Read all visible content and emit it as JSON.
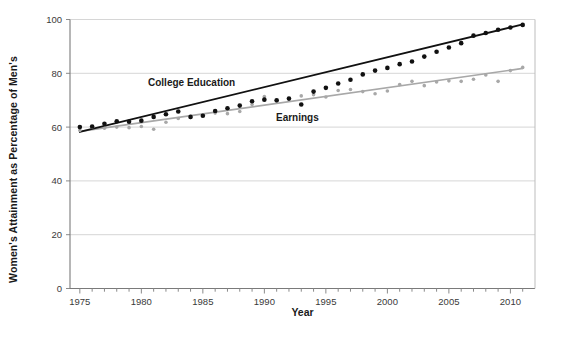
{
  "chart_data": {
    "type": "scatter",
    "title": "",
    "xlabel": "Year",
    "ylabel": "Women's Attainment as Percentage of Men's",
    "xlim": [
      1974.2,
      2012.0
    ],
    "ylim": [
      0,
      100
    ],
    "xticks": [
      1975,
      1980,
      1985,
      1990,
      1995,
      2000,
      2005,
      2010
    ],
    "xtick_labels": [
      "1975",
      "1980",
      "1985",
      "1990",
      "1995",
      "2000",
      "2005",
      "2010"
    ],
    "xtick_minor_step": 1,
    "yticks": [
      0,
      20,
      40,
      60,
      80,
      100
    ],
    "ytick_labels": [
      "0",
      "20",
      "40",
      "60",
      "80",
      "100"
    ],
    "grid": "horizontal",
    "legend_position": "inline-annotation",
    "series": [
      {
        "name": "College Education",
        "color": "#111111",
        "marker": "circle",
        "has_trendline": true,
        "trendline_color": "#111111",
        "trendline_start": [
          1975,
          58.2
        ],
        "trendline_end": [
          2011,
          98.2
        ],
        "x": [
          1975,
          1976,
          1977,
          1978,
          1979,
          1980,
          1981,
          1982,
          1983,
          1984,
          1985,
          1986,
          1987,
          1988,
          1989,
          1990,
          1991,
          1992,
          1993,
          1994,
          1995,
          1996,
          1997,
          1998,
          1999,
          2000,
          2001,
          2002,
          2003,
          2004,
          2005,
          2006,
          2007,
          2008,
          2009,
          2010,
          2011
        ],
        "y": [
          60.0,
          60.2,
          61.2,
          62.2,
          62.0,
          62.4,
          63.8,
          64.8,
          65.8,
          63.8,
          64.2,
          66.0,
          67.0,
          68.0,
          69.6,
          70.2,
          70.0,
          70.6,
          68.4,
          73.2,
          74.6,
          76.2,
          77.6,
          79.6,
          81.0,
          82.0,
          83.4,
          84.4,
          86.2,
          88.0,
          89.6,
          91.2,
          94.0,
          95.0,
          96.2,
          97.0,
          98.0
        ]
      },
      {
        "name": "Earnings",
        "color": "#a8a8a8",
        "marker": "circle",
        "has_trendline": true,
        "trendline_color": "#a8a8a8",
        "trendline_start": [
          1975,
          58.4
        ],
        "trendline_end": [
          2011,
          81.8
        ],
        "x": [
          1975,
          1976,
          1977,
          1978,
          1979,
          1980,
          1981,
          1982,
          1983,
          1984,
          1985,
          1986,
          1987,
          1988,
          1989,
          1990,
          1991,
          1992,
          1993,
          1994,
          1995,
          1996,
          1997,
          1998,
          1999,
          2000,
          2001,
          2002,
          2003,
          2004,
          2005,
          2006,
          2007,
          2008,
          2009,
          2010,
          2011
        ],
        "y": [
          58.8,
          60.0,
          59.6,
          60.0,
          59.8,
          60.2,
          59.2,
          61.8,
          63.2,
          63.6,
          64.6,
          65.2,
          65.0,
          65.8,
          68.4,
          71.4,
          69.6,
          70.6,
          71.6,
          72.0,
          71.2,
          73.6,
          74.0,
          73.2,
          72.4,
          73.4,
          75.8,
          77.0,
          75.4,
          76.8,
          77.2,
          77.0,
          77.8,
          79.4,
          77.0,
          81.0,
          82.2
        ]
      }
    ]
  },
  "axis": {
    "x_title": "Year",
    "y_title": "Women's Attainment as Percentage of Men's"
  },
  "annotations": {
    "college_label": "College Education",
    "earnings_label": "Earnings"
  }
}
